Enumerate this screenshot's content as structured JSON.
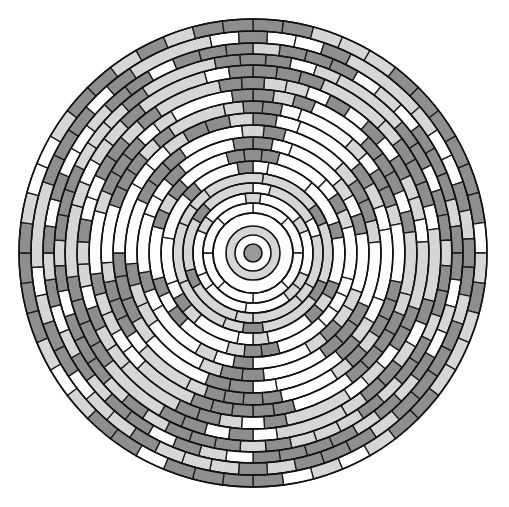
{
  "figure": {
    "title": "Concentric ring mosaic pattern",
    "center": [
      253,
      253
    ],
    "colors": {
      "white": "#ffffff",
      "light": "#d6d6d6",
      "mid": "#bdbdbd",
      "dark": "#8e8e8e",
      "center_dot": "#9a9a9a",
      "stroke": "#1a1a1a"
    },
    "core": {
      "dot_radius": 9,
      "inner_white_radius": 18,
      "inner_gray_radius": 27,
      "outer_white_radius": 40
    },
    "ring_radii": [
      40,
      50,
      60,
      70,
      80,
      92,
      104,
      116,
      128,
      140,
      152,
      164,
      176,
      188,
      199,
      210,
      222,
      234
    ],
    "spokes": {
      "count": 6,
      "angles_deg": [
        0,
        60,
        120,
        180,
        240,
        300
      ],
      "description": "Six radial spokes of gray blocks radiating from center to outer bands"
    }
  }
}
